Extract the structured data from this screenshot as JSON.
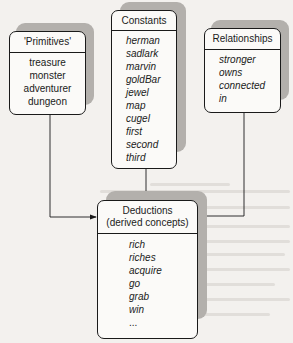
{
  "diagram": {
    "nodes": [
      {
        "id": "primitives",
        "title": "'Primitives'",
        "items": [
          "treasure",
          "monster",
          "adventurer",
          "dungeon"
        ]
      },
      {
        "id": "constants",
        "title": "Constants",
        "items": [
          "herman",
          "sadlark",
          "marvin",
          "goldBar",
          "jewel",
          "map",
          "cugel",
          "first",
          "second",
          "third"
        ]
      },
      {
        "id": "relationships",
        "title": "Relationships",
        "items": [
          "stronger",
          "owns",
          "connected",
          "in"
        ]
      },
      {
        "id": "deductions",
        "title_line1": "Deductions",
        "title_line2": "(derived concepts)",
        "items": [
          "rich",
          "riches",
          "acquire",
          "go",
          "grab",
          "win",
          "..."
        ]
      }
    ],
    "edges": [
      {
        "from": "primitives",
        "to": "deductions"
      },
      {
        "from": "constants",
        "to": "deductions"
      },
      {
        "from": "relationships",
        "to": "deductions"
      }
    ]
  },
  "colors": {
    "line": "#1a1a1a",
    "shadow": "#b3b0ac",
    "background": "#f3f1ee"
  }
}
